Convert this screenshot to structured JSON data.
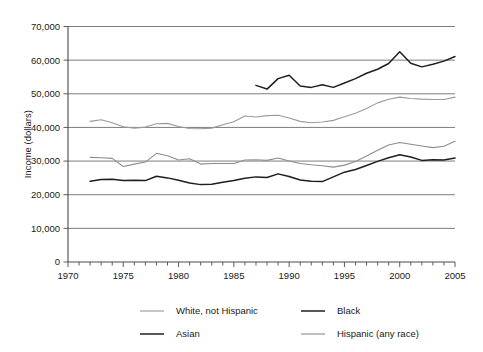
{
  "chart_data": {
    "type": "line",
    "title": "",
    "xlabel": "",
    "ylabel": "Income (dollars)",
    "xlim": [
      1970,
      2005
    ],
    "ylim": [
      0,
      70000
    ],
    "grid": true,
    "legend_position": "bottom",
    "y_ticks": [
      0,
      10000,
      20000,
      30000,
      40000,
      50000,
      60000,
      70000
    ],
    "y_tick_labels": [
      "0",
      "10,000",
      "20,000",
      "30,000",
      "40,000",
      "50,000",
      "60,000",
      "70,000"
    ],
    "x_ticks": [
      1970,
      1975,
      1980,
      1985,
      1990,
      1995,
      2000,
      2005
    ],
    "x_tick_labels": [
      "1970",
      "1975",
      "1980",
      "1985",
      "1990",
      "1995",
      "2000",
      "2005"
    ],
    "x_minor_tick_interval": 1,
    "series": [
      {
        "name": "White, not Hispanic",
        "color": "#9a9a9a",
        "width": 1.1,
        "x": [
          1972,
          1973,
          1974,
          1975,
          1976,
          1977,
          1978,
          1979,
          1980,
          1981,
          1982,
          1983,
          1984,
          1985,
          1986,
          1987,
          1988,
          1989,
          1990,
          1991,
          1992,
          1993,
          1994,
          1995,
          1996,
          1997,
          1998,
          1999,
          2000,
          2001,
          2002,
          2003,
          2004,
          2005
        ],
        "values": [
          41800,
          42300,
          41400,
          40200,
          39800,
          40100,
          41100,
          41200,
          40300,
          39700,
          39600,
          39800,
          40800,
          41700,
          43400,
          43100,
          43500,
          43600,
          42800,
          41800,
          41400,
          41600,
          42100,
          43200,
          44200,
          45600,
          47300,
          48400,
          49000,
          48600,
          48400,
          48300,
          48300,
          49000
        ]
      },
      {
        "name": "Black",
        "color": "#1e1e1e",
        "width": 1.5,
        "x": [
          1972,
          1973,
          1974,
          1975,
          1976,
          1977,
          1978,
          1979,
          1980,
          1981,
          1982,
          1983,
          1984,
          1985,
          1986,
          1987,
          1988,
          1989,
          1990,
          1991,
          1992,
          1993,
          1994,
          1995,
          1996,
          1997,
          1998,
          1999,
          2000,
          2001,
          2002,
          2003,
          2004,
          2005
        ],
        "values": [
          24000,
          24500,
          24600,
          24200,
          24300,
          24200,
          25500,
          25000,
          24300,
          23500,
          23000,
          23100,
          23700,
          24200,
          24900,
          25300,
          25100,
          26200,
          25400,
          24400,
          24000,
          23900,
          25300,
          26700,
          27500,
          28700,
          29900,
          31000,
          31900,
          31200,
          30200,
          30400,
          30300,
          30900
        ]
      },
      {
        "name": "Asian",
        "color": "#1e1e1e",
        "width": 1.5,
        "x": [
          1987,
          1988,
          1989,
          1990,
          1991,
          1992,
          1993,
          1994,
          1995,
          1996,
          1997,
          1998,
          1999,
          2000,
          2001,
          2002,
          2003,
          2004,
          2005
        ],
        "values": [
          52500,
          51400,
          54500,
          55500,
          52300,
          51900,
          52700,
          51900,
          53200,
          54500,
          56100,
          57300,
          59000,
          62500,
          59100,
          58000,
          58800,
          59700,
          61100
        ]
      },
      {
        "name": "Hispanic (any race)",
        "color": "#8d8d8d",
        "width": 1.1,
        "x": [
          1972,
          1973,
          1974,
          1975,
          1976,
          1977,
          1978,
          1979,
          1980,
          1981,
          1982,
          1983,
          1984,
          1985,
          1986,
          1987,
          1988,
          1989,
          1990,
          1991,
          1992,
          1993,
          1994,
          1995,
          1996,
          1997,
          1998,
          1999,
          2000,
          2001,
          2002,
          2003,
          2004,
          2005
        ],
        "values": [
          31100,
          31000,
          30800,
          28400,
          29100,
          29700,
          32300,
          31600,
          30300,
          30700,
          29100,
          29300,
          29300,
          29300,
          30300,
          30400,
          30200,
          30900,
          30000,
          29300,
          28900,
          28600,
          28200,
          28800,
          29900,
          31500,
          33200,
          34800,
          35500,
          35000,
          34500,
          34000,
          34400,
          35900
        ]
      }
    ]
  },
  "axes": {
    "ylabel": "Income (dollars)"
  },
  "legend": {
    "items": [
      {
        "label": "White, not Hispanic",
        "color": "#9a9a9a",
        "width": 1.1
      },
      {
        "label": "Black",
        "color": "#1e1e1e",
        "width": 1.5
      },
      {
        "label": "Asian",
        "color": "#1e1e1e",
        "width": 1.5
      },
      {
        "label": "Hispanic (any race)",
        "color": "#8d8d8d",
        "width": 1.1
      }
    ]
  }
}
